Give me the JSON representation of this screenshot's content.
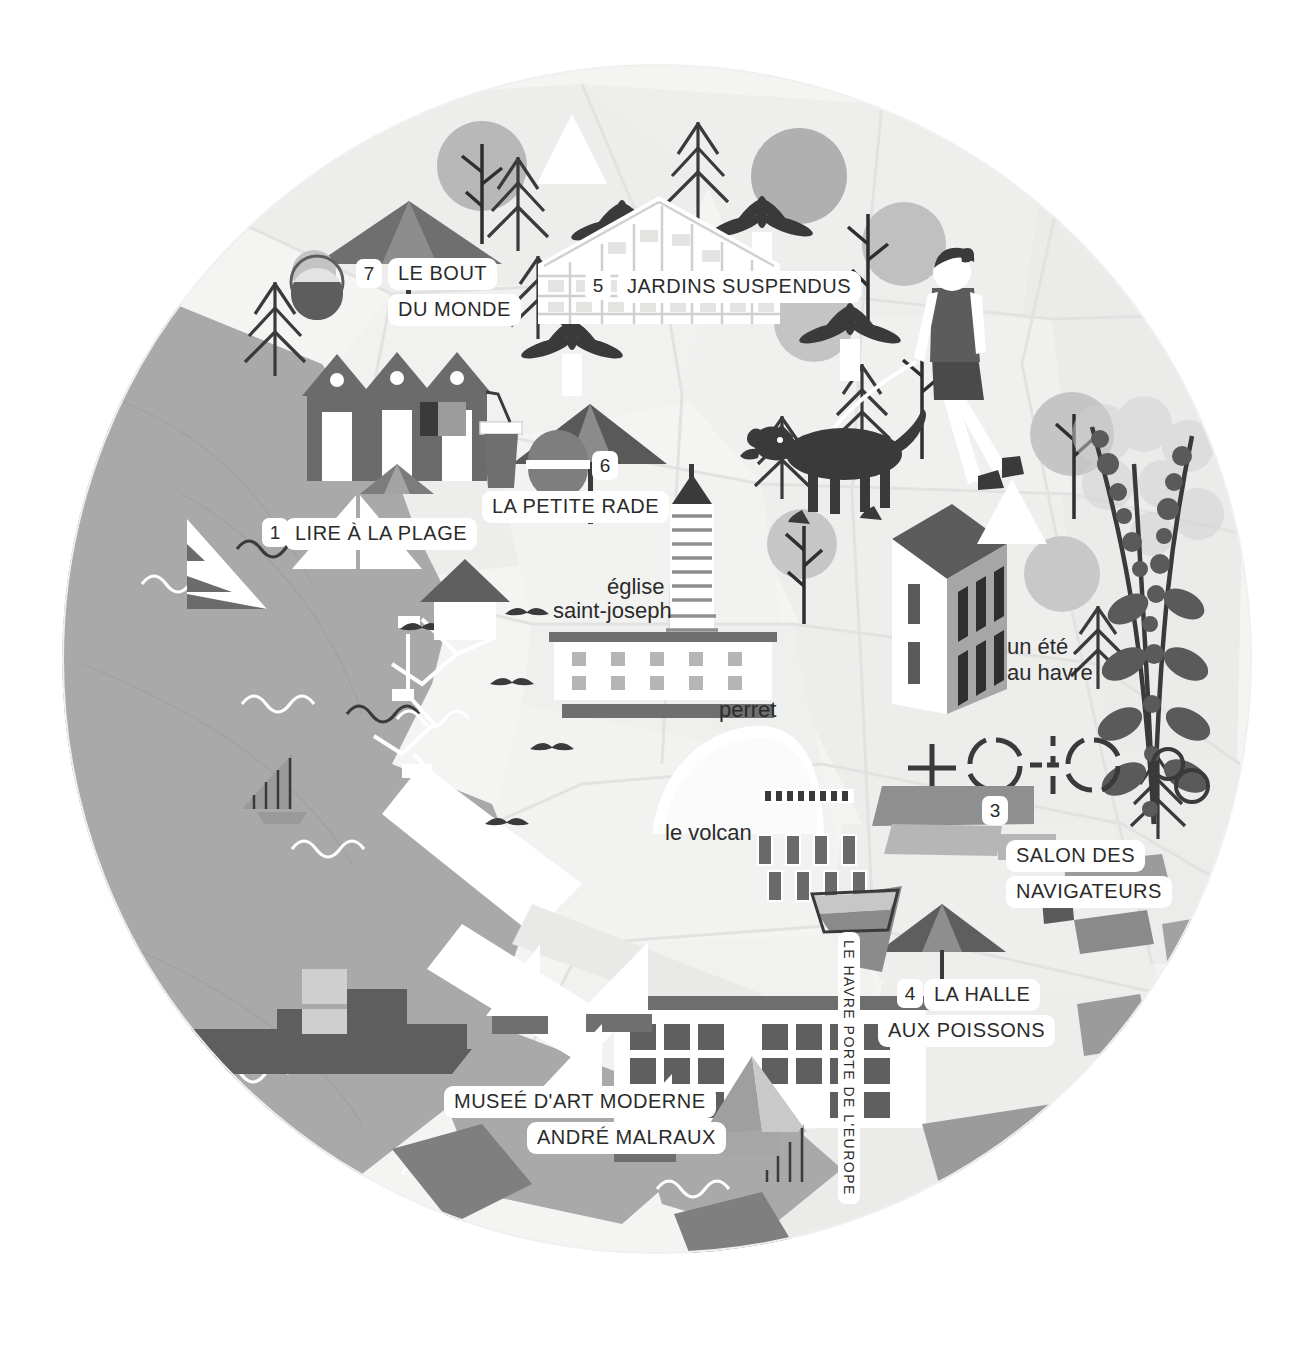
{
  "map": {
    "title": "Le Havre illustrated tourist map",
    "shape": "circle",
    "canvas": {
      "width": 1309,
      "height": 1354
    },
    "colors": {
      "background": "#ffffff",
      "land_light": "#f3f3f2",
      "land_mid": "#e8e8e7",
      "land_pale": "#eeeeed",
      "sea": "#a8a8a8",
      "dark_ink": "#3a3a3a",
      "mid_grey": "#8e8e8e",
      "light_grey": "#c9c9c9",
      "label_bg": "#ffffff",
      "text": "#2b2b2b"
    }
  },
  "numbered_points": [
    {
      "num": "1",
      "label": "LIRE À LA PLAGE",
      "lines": [
        "LIRE À LA PLAGE"
      ]
    },
    {
      "num": "3",
      "label": "SALON DES NAVIGATEURS",
      "lines": [
        "SALON DES",
        "NAVIGATEURS"
      ]
    },
    {
      "num": "4",
      "label": "LA HALLE AUX POISSONS",
      "lines": [
        "LA HALLE",
        "AUX POISSONS"
      ]
    },
    {
      "num": "5",
      "label": "JARDINS SUSPENDUS",
      "lines": [
        "JARDINS SUSPENDUS"
      ]
    },
    {
      "num": "6",
      "label": "LA PETITE RADE",
      "lines": [
        "LA PETITE RADE"
      ]
    },
    {
      "num": "7",
      "label": "LE BOUT DU MONDE",
      "lines": [
        "LE BOUT",
        "DU MONDE"
      ]
    }
  ],
  "labels": {
    "le_bout_line1": "LE BOUT",
    "le_bout_line2": "DU MONDE",
    "le_bout_num": "7",
    "jardins": "JARDINS SUSPENDUS",
    "jardins_num": "5",
    "petite_rade": "LA PETITE RADE",
    "petite_rade_num": "6",
    "lire_plage": "LIRE À LA PLAGE",
    "lire_plage_num": "1",
    "eglise_line1": "église",
    "eglise_line2": "saint-joseph",
    "perret": "perret",
    "un_ete_line1": "un été",
    "un_ete_line2": "au havre",
    "le_volcan": "le volcan",
    "salon_num": "3",
    "salon_line1": "SALON DES",
    "salon_line2": "NAVIGATEURS",
    "halle_num": "4",
    "halle_line1": "LA HALLE",
    "halle_line2": "AUX POISSONS",
    "musee_line1": "MUSEÉ D'ART MODERNE",
    "musee_line2": "ANDRÉ MALRAUX",
    "porte_europe": "LE HAVRE PORTE DE L'EUROPE"
  },
  "icons": [
    {
      "name": "beach-umbrella-icon",
      "count": 3
    },
    {
      "name": "pine-tree-icon",
      "count": 8
    },
    {
      "name": "palm-tree-icon",
      "count": 4
    },
    {
      "name": "round-tree-icon",
      "count": 7
    },
    {
      "name": "bare-tree-icon",
      "count": 4
    },
    {
      "name": "greenhouse-icon",
      "count": 1
    },
    {
      "name": "beach-hut-icon",
      "count": 3
    },
    {
      "name": "drink-cup-icon",
      "count": 1
    },
    {
      "name": "burger-icon",
      "count": 1
    },
    {
      "name": "wine-glass-icon",
      "count": 1
    },
    {
      "name": "woman-walking-dog-icon",
      "count": 1
    },
    {
      "name": "sailboat-icon",
      "count": 6
    },
    {
      "name": "cargo-ship-icon",
      "count": 1
    },
    {
      "name": "wave-icon",
      "count": 9
    },
    {
      "name": "seagull-icon",
      "count": 6
    },
    {
      "name": "port-crane-icon",
      "count": 2
    },
    {
      "name": "church-tower-icon",
      "count": 1
    },
    {
      "name": "perret-building-icon",
      "count": 1
    },
    {
      "name": "volcan-icon",
      "count": 1
    },
    {
      "name": "townhouse-icon",
      "count": 1
    },
    {
      "name": "flowering-branch-icon",
      "count": 1
    },
    {
      "name": "compass-rose-icon",
      "count": 1
    },
    {
      "name": "museum-building-icon",
      "count": 1
    },
    {
      "name": "rowboat-icon",
      "count": 1
    },
    {
      "name": "lighthouse-icon",
      "count": 1
    }
  ]
}
